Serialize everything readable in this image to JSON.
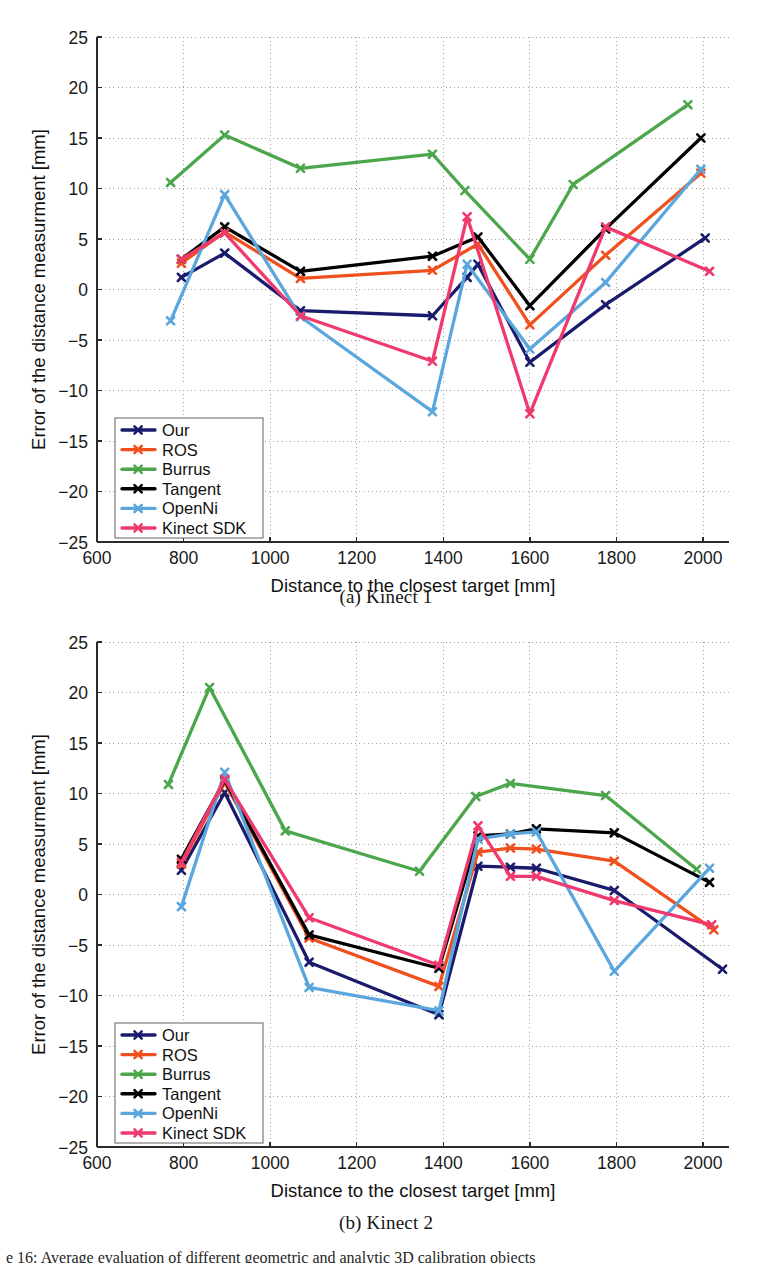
{
  "figure": {
    "subcaption_a": "(a)  Kinect 1",
    "subcaption_b": "(b)  Kinect 2",
    "bottom_caption_fragment": "e 16: Average evaluation of different geometric and analytic 3D calibration objects"
  },
  "axes": {
    "xlabel": "Distance to the closest target [mm]",
    "ylabel": "Error of the distance measurment [mm]",
    "xticks": [
      600,
      800,
      1000,
      1200,
      1400,
      1600,
      1800,
      2000
    ],
    "yticks": [
      -25,
      -20,
      -15,
      -10,
      -5,
      0,
      5,
      10,
      15,
      20,
      25
    ],
    "xtick_labels": [
      "600",
      "800",
      "1000",
      "1200",
      "1400",
      "1600",
      "1800",
      "2000"
    ],
    "ytick_labels": [
      "-25",
      "-20",
      "-15",
      "-10",
      "-5",
      "0",
      "5",
      "10",
      "15",
      "20",
      "25"
    ],
    "xlim": [
      600,
      2060
    ],
    "ylim": [
      -25,
      25
    ],
    "grid": "dotted"
  },
  "legend": {
    "position": "lower-left",
    "entries": [
      {
        "label": "Our",
        "color": "#1b1b6e"
      },
      {
        "label": "ROS",
        "color": "#f0501e"
      },
      {
        "label": "Burrus",
        "color": "#4ca64c"
      },
      {
        "label": "Tangent",
        "color": "#000000"
      },
      {
        "label": "OpenNi",
        "color": "#5ba7dd"
      },
      {
        "label": "Kinect SDK",
        "color": "#ef3a6e"
      }
    ]
  },
  "chart_data": [
    {
      "type": "line",
      "title": "(a)  Kinect 1",
      "xlabel": "Distance to the closest target [mm]",
      "ylabel": "Error of the distance measurment [mm]",
      "xlim": [
        600,
        2060
      ],
      "ylim": [
        -25,
        25
      ],
      "grid": true,
      "legend_position": "lower-left",
      "series": [
        {
          "name": "Our",
          "color": "#1b1b6e",
          "x": [
            795,
            895,
            1070,
            1375,
            1455,
            1480,
            1600,
            1775,
            2005
          ],
          "y": [
            1.2,
            3.6,
            -2.1,
            -2.6,
            1.2,
            2.5,
            -7.2,
            -1.5,
            5.1
          ]
        },
        {
          "name": "ROS",
          "color": "#f0501e",
          "x": [
            795,
            895,
            1070,
            1375,
            1480,
            1600,
            1775,
            1995
          ],
          "y": [
            2.6,
            5.7,
            1.1,
            1.9,
            4.5,
            -3.5,
            3.4,
            11.5
          ]
        },
        {
          "name": "Burrus",
          "color": "#4ca64c",
          "x": [
            770,
            895,
            1070,
            1375,
            1450,
            1600,
            1700,
            1965
          ],
          "y": [
            10.6,
            15.3,
            12.0,
            13.4,
            9.8,
            3.0,
            10.4,
            18.3
          ]
        },
        {
          "name": "Tangent",
          "color": "#000000",
          "x": [
            795,
            895,
            1070,
            1375,
            1480,
            1600,
            1775,
            1995
          ],
          "y": [
            3.0,
            6.2,
            1.8,
            3.3,
            5.2,
            -1.6,
            6.0,
            15.0
          ]
        },
        {
          "name": "OpenNi",
          "color": "#5ba7dd",
          "x": [
            770,
            895,
            1070,
            1375,
            1455,
            1600,
            1775,
            1995
          ],
          "y": [
            -3.1,
            9.4,
            -2.7,
            -12.1,
            2.5,
            -5.9,
            0.7,
            11.9
          ]
        },
        {
          "name": "Kinect SDK",
          "color": "#ef3a6e",
          "x": [
            795,
            895,
            1070,
            1375,
            1455,
            1600,
            1775,
            2015
          ],
          "y": [
            3.0,
            5.6,
            -2.6,
            -7.1,
            7.2,
            -12.3,
            6.2,
            1.8
          ]
        }
      ]
    },
    {
      "type": "line",
      "title": "(b)  Kinect 2",
      "xlabel": "Distance to the closest target [mm]",
      "ylabel": "Error of the distance measurment [mm]",
      "xlim": [
        600,
        2060
      ],
      "ylim": [
        -25,
        25
      ],
      "grid": true,
      "legend_position": "lower-left",
      "series": [
        {
          "name": "Our",
          "color": "#1b1b6e",
          "x": [
            795,
            895,
            1090,
            1390,
            1480,
            1555,
            1615,
            1795,
            2045
          ],
          "y": [
            2.4,
            10.1,
            -6.7,
            -11.9,
            2.8,
            2.7,
            2.6,
            0.4,
            -7.4
          ]
        },
        {
          "name": "ROS",
          "color": "#f0501e",
          "x": [
            795,
            895,
            1090,
            1390,
            1480,
            1555,
            1615,
            1795,
            2025
          ],
          "y": [
            3.0,
            11.1,
            -4.3,
            -9.1,
            4.2,
            4.6,
            4.5,
            3.3,
            -3.5
          ]
        },
        {
          "name": "Burrus",
          "color": "#4ca64c",
          "x": [
            765,
            860,
            1035,
            1345,
            1475,
            1555,
            1775,
            1985
          ],
          "y": [
            10.9,
            20.5,
            6.3,
            2.3,
            9.7,
            11.0,
            9.8,
            2.5
          ]
        },
        {
          "name": "Tangent",
          "color": "#000000",
          "x": [
            795,
            895,
            1090,
            1390,
            1480,
            1555,
            1615,
            1795,
            2015
          ],
          "y": [
            3.5,
            11.3,
            -4.0,
            -7.3,
            5.8,
            6.0,
            6.5,
            6.1,
            1.2
          ]
        },
        {
          "name": "OpenNi",
          "color": "#5ba7dd",
          "x": [
            795,
            895,
            1090,
            1390,
            1480,
            1555,
            1615,
            1795,
            2015
          ],
          "y": [
            -1.2,
            12.1,
            -9.2,
            -11.5,
            5.5,
            6.0,
            6.2,
            -7.6,
            2.6
          ]
        },
        {
          "name": "Kinect SDK",
          "color": "#ef3a6e",
          "x": [
            795,
            895,
            1090,
            1390,
            1480,
            1555,
            1615,
            1795,
            2020
          ],
          "y": [
            3.2,
            11.4,
            -2.3,
            -7.0,
            6.8,
            1.8,
            1.8,
            -0.6,
            -3.0
          ]
        }
      ]
    }
  ]
}
